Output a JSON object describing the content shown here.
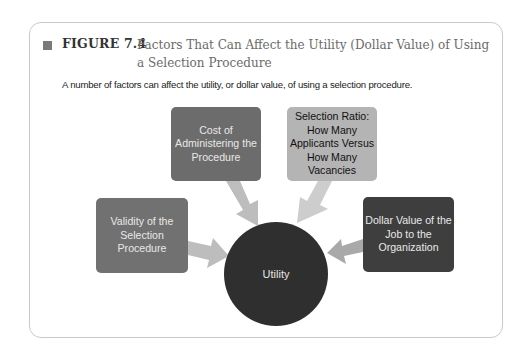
{
  "figure": {
    "label": "FIGURE 7.4",
    "title": "Factors That Can Affect the Utility (Dollar Value) of Using a Selection Procedure",
    "caption": "A number of factors can affect the utility, or dollar value, of using a selection procedure."
  },
  "diagram": {
    "center": {
      "label": "Utility",
      "color": "#2f2f2f"
    },
    "factors": [
      {
        "id": "cost",
        "label": "Cost of Administering the Procedure",
        "color": "#6c6c6c"
      },
      {
        "id": "selection-ratio",
        "label": "Selection Ratio: How Many Applicants Versus How Many Vacancies",
        "color": "#b4b4b4"
      },
      {
        "id": "validity",
        "label": "Validity of the Selection Procedure",
        "color": "#717171"
      },
      {
        "id": "dollar-value",
        "label": "Dollar Value of the Job to the Organization",
        "color": "#3e3e3e"
      }
    ],
    "edges": [
      {
        "from": "cost",
        "to": "utility"
      },
      {
        "from": "selection-ratio",
        "to": "utility"
      },
      {
        "from": "validity",
        "to": "utility"
      },
      {
        "from": "dollar-value",
        "to": "utility"
      }
    ]
  }
}
